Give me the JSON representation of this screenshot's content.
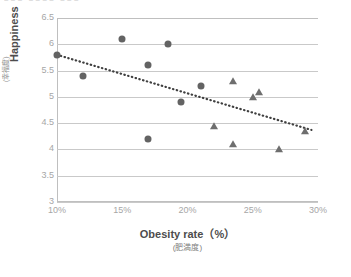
{
  "title_remnant": "■■■ ■■■■ ■■■",
  "colors": {
    "marker": "#636363",
    "trendline": "#3f3f3f",
    "gridline": "#c9c9c9",
    "axis": "#bfbfbf",
    "tick_text": "#a6a6a6",
    "axis_title": "#4d4d4d"
  },
  "chart_data": {
    "type": "scatter",
    "title": "",
    "xlabel": "Obesity rate（%）",
    "xlabel_sub": "(肥満度)",
    "ylabel": "Happiness",
    "ylabel_sub": "(幸福度)",
    "xlim": [
      10,
      30
    ],
    "ylim": [
      3,
      6.5
    ],
    "grid": true,
    "legend": "none",
    "x_tick_labels": [
      "10%",
      "15%",
      "20%",
      "25%",
      "30%"
    ],
    "x_tick_values": [
      10,
      15,
      20,
      25,
      30
    ],
    "y_tick_labels": [
      "6.5",
      "6",
      "5.5",
      "5",
      "4.5",
      "4",
      "3.5",
      "3"
    ],
    "y_tick_values": [
      6.5,
      6,
      5.5,
      5,
      4.5,
      4,
      3.5,
      3
    ],
    "series": [
      {
        "name": "circle-series",
        "marker": "circle",
        "points": [
          {
            "x": 10.0,
            "y": 5.8
          },
          {
            "x": 12.0,
            "y": 5.4
          },
          {
            "x": 15.0,
            "y": 6.1
          },
          {
            "x": 17.0,
            "y": 5.6
          },
          {
            "x": 17.0,
            "y": 4.2
          },
          {
            "x": 18.5,
            "y": 6.0
          },
          {
            "x": 19.5,
            "y": 4.9
          },
          {
            "x": 21.0,
            "y": 5.2
          }
        ]
      },
      {
        "name": "triangle-series",
        "marker": "triangle",
        "points": [
          {
            "x": 22.0,
            "y": 4.45
          },
          {
            "x": 23.5,
            "y": 5.3
          },
          {
            "x": 23.5,
            "y": 4.1
          },
          {
            "x": 25.0,
            "y": 5.0
          },
          {
            "x": 25.5,
            "y": 5.1
          },
          {
            "x": 27.0,
            "y": 4.0
          },
          {
            "x": 29.0,
            "y": 4.35
          }
        ]
      }
    ],
    "trendline": {
      "style": "dotted",
      "x_start": 10.0,
      "y_start": 5.8,
      "x_end": 29.5,
      "y_end": 4.37
    }
  }
}
